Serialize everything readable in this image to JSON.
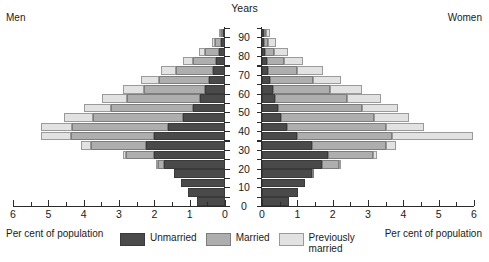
{
  "header": {
    "men_label": "Men",
    "women_label": "Women",
    "years_label": "Years"
  },
  "footer": {
    "left_caption": "Per cent of\npopulation",
    "right_caption": "Per cent of\npopulation"
  },
  "legend": {
    "items": [
      {
        "key": "unmarried",
        "label": "Unmarried",
        "color": "#4a4a4a"
      },
      {
        "key": "married",
        "label": "Married",
        "color": "#aeaeae"
      },
      {
        "key": "prev",
        "label": "Previously\nmarried",
        "color": "#e2e2e2"
      }
    ]
  },
  "chart_data": {
    "type": "bar",
    "subtype": "population-pyramid",
    "title": "",
    "xlabel": "Per cent of population",
    "ylabel": "Years",
    "xlim": [
      0,
      6
    ],
    "ylim": [
      0,
      95
    ],
    "grid": false,
    "legend_position": "bottom-center",
    "x_ticks_major": [
      0,
      1,
      2,
      3,
      4,
      5,
      6
    ],
    "x_ticks_minor": [
      0.5,
      1.5,
      2.5,
      3.5,
      4.5,
      5.5
    ],
    "y_ticks_major": [
      0,
      10,
      20,
      30,
      40,
      50,
      60,
      70,
      80,
      90
    ],
    "y_ticks_minor": [
      5,
      15,
      25,
      35,
      45,
      55,
      65,
      75,
      85,
      95
    ],
    "categories": [
      "0-4",
      "5-9",
      "10-14",
      "15-19",
      "20-24",
      "25-29",
      "30-34",
      "35-39",
      "40-44",
      "45-49",
      "50-54",
      "55-59",
      "60-64",
      "65-69",
      "70-74",
      "75-79",
      "80-84",
      "85-89",
      "90+"
    ],
    "sides": [
      "Men",
      "Women"
    ],
    "series": [
      {
        "side": "Men",
        "name": "Unmarried",
        "color": "#4a4a4a",
        "values": [
          0.78,
          1.05,
          1.25,
          1.45,
          1.72,
          2.0,
          2.25,
          2.0,
          1.62,
          1.2,
          0.92,
          0.72,
          0.58,
          0.46,
          0.35,
          0.26,
          0.18,
          0.1,
          0.05
        ]
      },
      {
        "side": "Men",
        "name": "Married",
        "color": "#aeaeae",
        "values": [
          0.0,
          0.0,
          0.0,
          0.0,
          0.18,
          0.8,
          1.55,
          2.35,
          2.7,
          2.55,
          2.3,
          2.05,
          1.72,
          1.42,
          1.05,
          0.66,
          0.38,
          0.18,
          0.07
        ]
      },
      {
        "side": "Men",
        "name": "Previously married",
        "color": "#e2e2e2",
        "values": [
          0.0,
          0.0,
          0.0,
          0.0,
          0.02,
          0.1,
          0.28,
          0.85,
          0.88,
          0.82,
          0.78,
          0.7,
          0.6,
          0.5,
          0.4,
          0.28,
          0.18,
          0.09,
          0.04
        ]
      },
      {
        "side": "Women",
        "name": "Unmarried",
        "color": "#4a4a4a",
        "values": [
          0.76,
          1.02,
          1.22,
          1.42,
          1.7,
          1.88,
          1.42,
          0.98,
          0.72,
          0.55,
          0.44,
          0.36,
          0.3,
          0.24,
          0.18,
          0.13,
          0.09,
          0.06,
          0.03
        ]
      },
      {
        "side": "Women",
        "name": "Married",
        "color": "#aeaeae",
        "values": [
          0.0,
          0.0,
          0.0,
          0.05,
          0.48,
          1.25,
          2.1,
          2.7,
          2.78,
          2.62,
          2.4,
          2.05,
          1.62,
          1.2,
          0.82,
          0.48,
          0.26,
          0.12,
          0.04
        ]
      },
      {
        "side": "Women",
        "name": "Previously married",
        "color": "#e2e2e2",
        "values": [
          0.0,
          0.0,
          0.0,
          0.0,
          0.04,
          0.12,
          0.26,
          2.28,
          1.08,
          1.0,
          1.0,
          0.95,
          0.9,
          0.8,
          0.72,
          0.55,
          0.38,
          0.22,
          0.1
        ]
      }
    ]
  }
}
